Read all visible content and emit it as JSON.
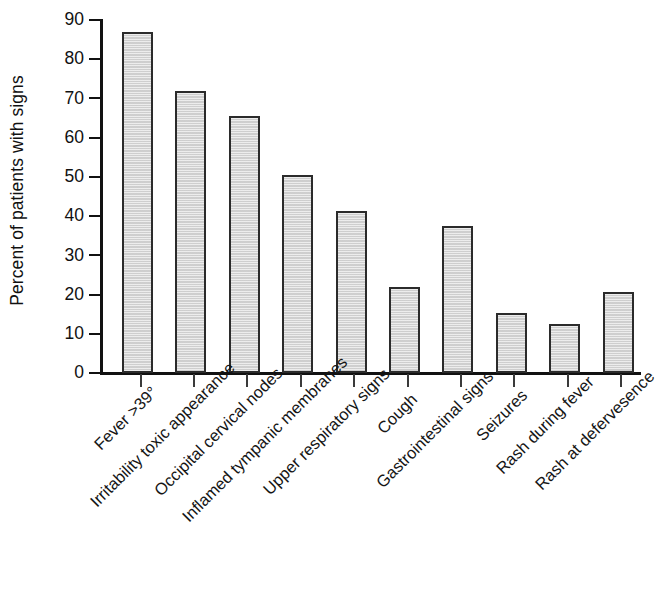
{
  "chart_data": {
    "type": "bar",
    "title": "",
    "subtitle": "",
    "xlabel": "",
    "ylabel": "Percent of patients with signs",
    "ylim": [
      0,
      90
    ],
    "ytick_step": 10,
    "yticks": [
      "0",
      "10",
      "20",
      "30",
      "40",
      "50",
      "60",
      "70",
      "80",
      "90"
    ],
    "grid": false,
    "legend": null,
    "orientation": "vertical",
    "bar_fill_color": "#d6d6d6",
    "bar_edge_color": "#2b2b2b",
    "categories": [
      "Fever >39°",
      "Irritability toxic appearance",
      "Occipital cervical nodes",
      "Inflamed tympanic membranes",
      "Upper respiratory signs",
      "Cough",
      "Gastrointestinal signs",
      "Seizures",
      "Rash during fever",
      "Rash at defervesence"
    ],
    "values": [
      87.0,
      72.0,
      65.5,
      50.5,
      41.2,
      22.0,
      37.5,
      15.3,
      12.5,
      20.7
    ]
  }
}
